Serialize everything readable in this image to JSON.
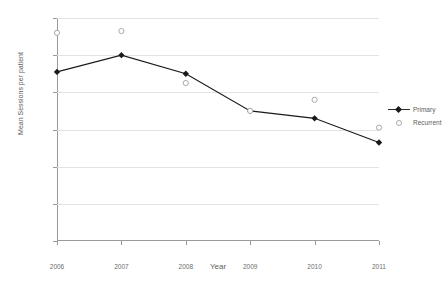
{
  "chart_data": {
    "type": "line",
    "title": "",
    "xlabel": "Year",
    "ylabel": "Mean Sessions per patient",
    "categories": [
      "2006",
      "2007",
      "2008",
      "2009",
      "2010",
      "2011"
    ],
    "xlim": [
      2006,
      2011
    ],
    "ylim": [
      0.0,
      6.0
    ],
    "yticks": [
      "0.0",
      "1.0",
      "2.0",
      "3.0",
      "4.0",
      "5.0",
      "6.0"
    ],
    "ytick_values": [
      0.0,
      1.0,
      2.0,
      3.0,
      4.0,
      5.0,
      6.0
    ],
    "grid": "horizontal",
    "legend_position": "right",
    "series": [
      {
        "name": "Primary",
        "marker": "filled-diamond",
        "color": "#1a1a1a",
        "line": "solid",
        "values": [
          4.55,
          5.0,
          4.5,
          3.5,
          3.3,
          2.65
        ]
      },
      {
        "name": "Recurrent",
        "marker": "open-circle",
        "color": "#a9a9a9",
        "line": "none",
        "values": [
          5.6,
          5.65,
          4.25,
          3.5,
          3.8,
          3.05
        ]
      }
    ]
  },
  "legend": {
    "items": [
      {
        "label": "Primary"
      },
      {
        "label": "Recurrent"
      }
    ]
  }
}
